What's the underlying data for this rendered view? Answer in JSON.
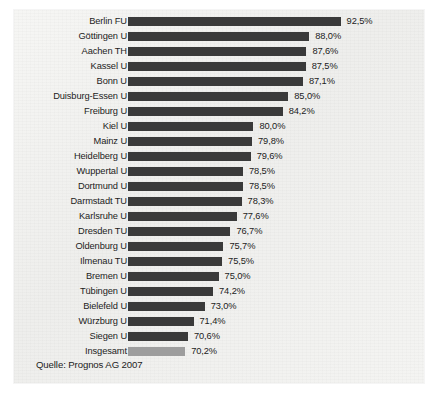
{
  "source_note": "Quelle: Prognos AG 2007",
  "chart_data": {
    "type": "bar",
    "orientation": "horizontal",
    "title": "",
    "xlabel": "",
    "ylabel": "",
    "grid": false,
    "legend": null,
    "value_suffix": "%",
    "decimal_separator": ",",
    "axis_baseline_percent": 62,
    "axis_max_percent": 95,
    "colors": {
      "bar": "#3a3a3a",
      "total_bar": "#9d9d9d",
      "panel_background": "#f2f2f0",
      "text": "#1c1c1c"
    },
    "categories": [
      "Berlin FU",
      "Göttingen U",
      "Aachen TH",
      "Kassel U",
      "Bonn U",
      "Duisburg-Essen U",
      "Freiburg U",
      "Kiel U",
      "Mainz U",
      "Heidelberg U",
      "Wuppertal U",
      "Dortmund U",
      "Darmstadt TU",
      "Karlsruhe U",
      "Dresden TU",
      "Oldenburg U",
      "Ilmenau TU",
      "Bremen U",
      "Tübingen U",
      "Bielefeld U",
      "Würzburg U",
      "Siegen U",
      "Insgesamt"
    ],
    "values": [
      92.5,
      88.0,
      87.6,
      87.5,
      87.1,
      85.0,
      84.2,
      80.0,
      79.8,
      79.6,
      78.5,
      78.5,
      78.3,
      77.6,
      76.7,
      75.7,
      75.5,
      75.0,
      74.2,
      73.0,
      71.4,
      70.6,
      70.2
    ],
    "value_labels": [
      "92,5%",
      "88,0%",
      "87,6%",
      "87,5%",
      "87,1%",
      "85,0%",
      "84,2%",
      "80,0%",
      "79,8%",
      "79,6%",
      "78,5%",
      "78,5%",
      "78,3%",
      "77,6%",
      "76,7%",
      "75,7%",
      "75,5%",
      "75,0%",
      "74,2%",
      "73,0%",
      "71,4%",
      "70,6%",
      "70,2%"
    ],
    "total_index": 22
  }
}
